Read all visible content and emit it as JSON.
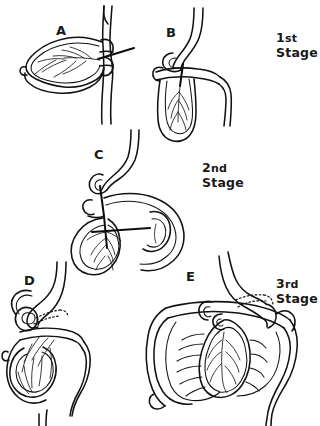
{
  "figure": {
    "background_color": "#fdfdfd",
    "ink_color": "#121214",
    "width": 320,
    "height": 426
  },
  "panels": [
    {
      "id": "A",
      "label": "A",
      "label_x": 56,
      "label_y": 24,
      "stage": "1st Stage",
      "caption": "Midgut loop herniated, superior mesenteric artery in the axis, loop lying in the sagittal plane"
    },
    {
      "id": "B",
      "label": "B",
      "label_x": 166,
      "label_y": 26,
      "stage": "1st Stage",
      "caption": "Loop rotated 90 degrees counterclockwise, cranial limb to the right, caudal limb to the left"
    },
    {
      "id": "C",
      "label": "C",
      "label_x": 94,
      "label_y": 148,
      "stage": "2nd Stage",
      "caption": "Further 90 degree rotation during reduction of the hernia, duodenum passing behind the artery"
    },
    {
      "id": "D",
      "label": "D",
      "label_x": 24,
      "label_y": 274,
      "stage": "3rd Stage",
      "caption": "Caecum descending, duodenum fixed retroperitoneally shown by dotted outline"
    },
    {
      "id": "E",
      "label": "E",
      "label_x": 186,
      "label_y": 270,
      "stage": "3rd Stage",
      "caption": "Final arrangement, colon framing the coiled small intestine, caecum in the right iliac fossa"
    }
  ],
  "stage_labels": [
    {
      "id": "stage-1",
      "ordinal": "1",
      "suffix": "st",
      "word": "Stage",
      "x": 276,
      "y": 30
    },
    {
      "id": "stage-2",
      "ordinal": "2",
      "suffix": "nd",
      "word": "Stage",
      "x": 202,
      "y": 160
    },
    {
      "id": "stage-3",
      "ordinal": "3",
      "suffix": "rd",
      "word": "Stage",
      "x": 276,
      "y": 276
    }
  ]
}
